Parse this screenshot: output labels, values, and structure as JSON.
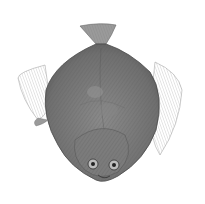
{
  "image": {
    "subject": "flatfish illustration",
    "description": "Engraved grayscale illustration of a flatfish (flounder) viewed from above, tail at top, eyes near bottom",
    "colors": {
      "background": "#ffffff",
      "body": "#7a7a7a",
      "body_dark": "#5a5a5a",
      "fins": "#a8a8a8",
      "outline": "#4a4a4a"
    }
  }
}
